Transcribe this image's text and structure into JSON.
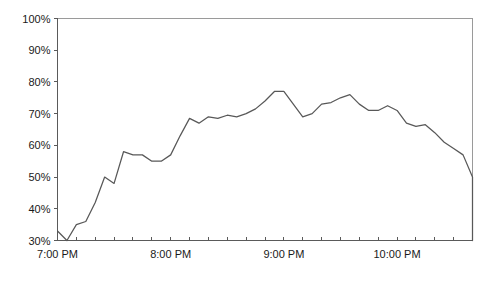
{
  "chart_data": {
    "type": "line",
    "title": "",
    "subtitle": "",
    "xlabel": "",
    "ylabel": "",
    "grid": false,
    "legend": "none",
    "legend_entries": [],
    "annotations": [],
    "line_color": "#585858",
    "axis_color": "#5a5a5a",
    "frame_color": "#9a9a9a",
    "background_color": "#ffffff",
    "ylim": [
      30,
      100
    ],
    "ytick_labels": [
      "100%",
      "90%",
      "80%",
      "70%",
      "60%",
      "50%",
      "40%",
      "30%"
    ],
    "ytick_values": [
      100,
      90,
      80,
      70,
      60,
      50,
      40,
      30
    ],
    "xtick_labels": [
      "7:00 PM",
      "8:00 PM",
      "9:00 PM",
      "10:00 PM"
    ],
    "xtick_values": [
      0,
      60,
      120,
      180
    ],
    "xlim_minutes": [
      0,
      220
    ],
    "x_minor_tick_interval_minutes": 10,
    "x_unit": "minutes after 7:00 PM",
    "series": [
      {
        "name": "",
        "x": [
          0,
          5,
          10,
          15,
          20,
          25,
          30,
          35,
          40,
          45,
          50,
          55,
          60,
          65,
          70,
          75,
          80,
          85,
          90,
          95,
          100,
          105,
          110,
          115,
          120,
          125,
          130,
          135,
          140,
          145,
          150,
          155,
          160,
          165,
          170,
          175,
          180,
          185,
          190,
          195,
          200,
          205,
          210,
          215,
          220
        ],
        "values": [
          33,
          30,
          35,
          36,
          42,
          50,
          48,
          58,
          57,
          57,
          55,
          55,
          57,
          63,
          68.5,
          67,
          69,
          68.5,
          69.5,
          69,
          70,
          71.5,
          74,
          77,
          77,
          73,
          69,
          70,
          73,
          73.5,
          75,
          76,
          73,
          71,
          71,
          72.5,
          71,
          67,
          66,
          66.5,
          64,
          61,
          59,
          57,
          50
        ]
      }
    ]
  }
}
